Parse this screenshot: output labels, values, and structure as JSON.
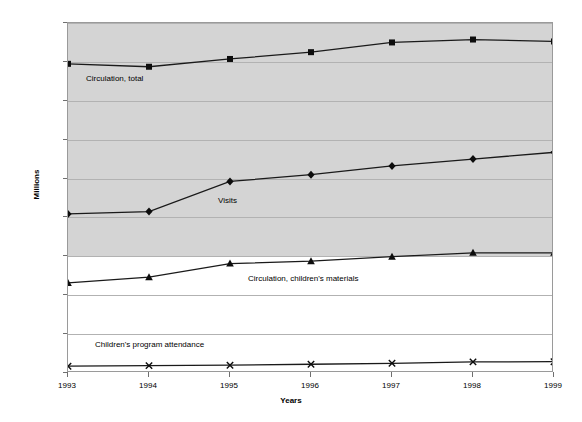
{
  "chart_data": {
    "type": "line",
    "title": "",
    "xlabel": "Years",
    "ylabel": "Millions",
    "categories": [
      "1993",
      "1994",
      "1995",
      "1996",
      "1997",
      "1998",
      "1999"
    ],
    "xlim": [
      1993,
      1999
    ],
    "ylim": [
      0,
      1800
    ],
    "y_ticks": [
      "0",
      "200",
      "400",
      "600",
      "800",
      "1,000",
      "1,200",
      "1,400",
      "1,600",
      "1,800"
    ],
    "y_tick_values": [
      0,
      200,
      400,
      600,
      800,
      1000,
      1200,
      1400,
      1600,
      1800
    ],
    "grid": true,
    "legend_position": "inline-labels",
    "series": [
      {
        "name": "Circulation, total",
        "marker": "square",
        "values": [
          1590,
          1575,
          1615,
          1650,
          1700,
          1715,
          1705
        ]
      },
      {
        "name": "Visits",
        "marker": "diamond",
        "values": [
          818,
          830,
          985,
          1020,
          1065,
          1100,
          1135
        ]
      },
      {
        "name": "Circulation, children's materials",
        "marker": "triangle",
        "values": [
          463,
          493,
          563,
          575,
          598,
          618,
          618
        ]
      },
      {
        "name": "Children's program attendance",
        "marker": "cross",
        "values": [
          35,
          38,
          40,
          45,
          50,
          57,
          58
        ]
      }
    ]
  },
  "annotations": [
    {
      "text": "Circulation, total",
      "x_px": 86,
      "y_px": 74
    },
    {
      "text": "Visits",
      "x_px": 218,
      "y_px": 196
    },
    {
      "text": "Circulation, children's materials",
      "x_px": 248,
      "y_px": 274
    },
    {
      "text": "Children's program attendance",
      "x_px": 95,
      "y_px": 340
    }
  ],
  "style": {
    "plot_shade_color": "#d4d4d4",
    "plot_background_color": "#ffffff",
    "line_color": "#1a1a1a",
    "grid_color": "#b2b2b2",
    "axis_color": "#9a9a9a"
  }
}
